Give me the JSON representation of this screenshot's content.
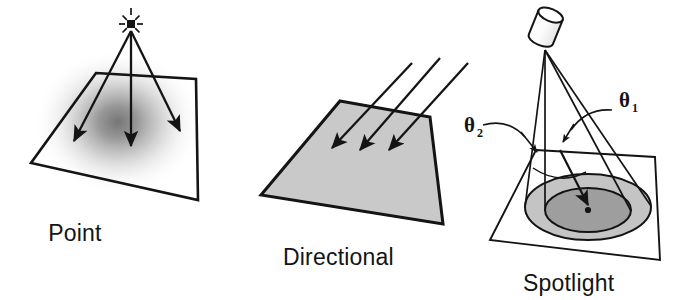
{
  "figure": {
    "background_color": "#ffffff",
    "ink_color": "#141414",
    "width": 684,
    "height": 300
  },
  "panels": [
    {
      "id": "point",
      "caption": "Point",
      "caption_x": 75,
      "caption_y": 241,
      "surface_fill": "none",
      "surface_style": "outline-only-with-radial-falloff",
      "light_source_icon": "point-light-burst-icon",
      "ray_count": 3,
      "description": "Point light above an unfilled quadrilateral ground plane; rays diverge from a single point and a soft radial gradient hot-spot appears on the surface."
    },
    {
      "id": "directional",
      "caption": "Directional",
      "caption_x": 283,
      "caption_y": 265,
      "surface_fill": "#c9c9c9",
      "surface_style": "flat-gray-fill",
      "light_source_icon": "parallel-rays-icon",
      "ray_count": 3,
      "description": "Three parallel arrows strike a uniformly shaded quadrilateral ground plane."
    },
    {
      "id": "spotlight",
      "caption": "Spotlight",
      "caption_x": 523,
      "caption_y": 291,
      "surface_fill": "none",
      "surface_style": "outline-with-two-concentric-pools",
      "light_source_icon": "spotlight-cylinder-icon",
      "ray_count": 4,
      "inner_pool_fill": "#9e9e9e",
      "outer_pool_fill": "#c4c4c4",
      "description": "A cylindrical spotlight casts a cone onto the ground, producing an inner bright cone and an outer penumbra ring."
    }
  ],
  "annotations": [
    {
      "id": "theta-1",
      "symbol": "θ",
      "subscript": "1",
      "label_x": 619,
      "label_y": 107,
      "points_to": "inner-cone-half-angle",
      "leader": "curved-arrow-leader"
    },
    {
      "id": "theta-2",
      "symbol": "θ",
      "subscript": "2",
      "label_x": 464,
      "label_y": 132,
      "points_to": "outer-cone-half-angle",
      "leader": "curved-arrow-leader"
    }
  ]
}
